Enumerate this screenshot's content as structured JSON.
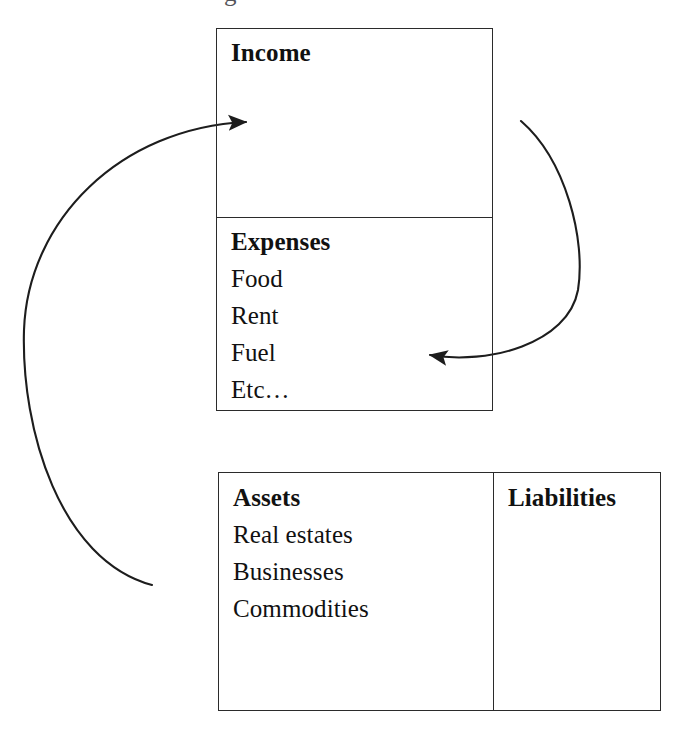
{
  "diagram": {
    "stroke_color": "#2b2b2b",
    "background_color": "#ffffff",
    "top_clipped_fragment": "g"
  },
  "statement": {
    "income": {
      "heading": "Income",
      "items": []
    },
    "expenses": {
      "heading": "Expenses",
      "items": [
        "Food",
        "Rent",
        "Fuel",
        "Etc…"
      ]
    }
  },
  "balance_sheet": {
    "assets": {
      "heading": "Assets",
      "items": [
        "Real estates",
        "Businesses",
        "Commodities"
      ]
    },
    "liabilities": {
      "heading": "Liabilities",
      "items": []
    }
  },
  "arrows": [
    {
      "name": "assets-to-income-arrow",
      "label": "",
      "from": "assets",
      "to": "income",
      "direction": "right",
      "path": "M152,585 C60,560 21,430 24,330 C28,220 120,128 246,122",
      "tip": [
        250,
        123
      ]
    },
    {
      "name": "income-to-expenses-arrow",
      "label": "",
      "from": "income",
      "to": "expenses",
      "direction": "left",
      "path": "M521,121 C566,160 586,240 578,290 C568,344 488,365 430,355",
      "tip": [
        424,
        354
      ]
    }
  ]
}
